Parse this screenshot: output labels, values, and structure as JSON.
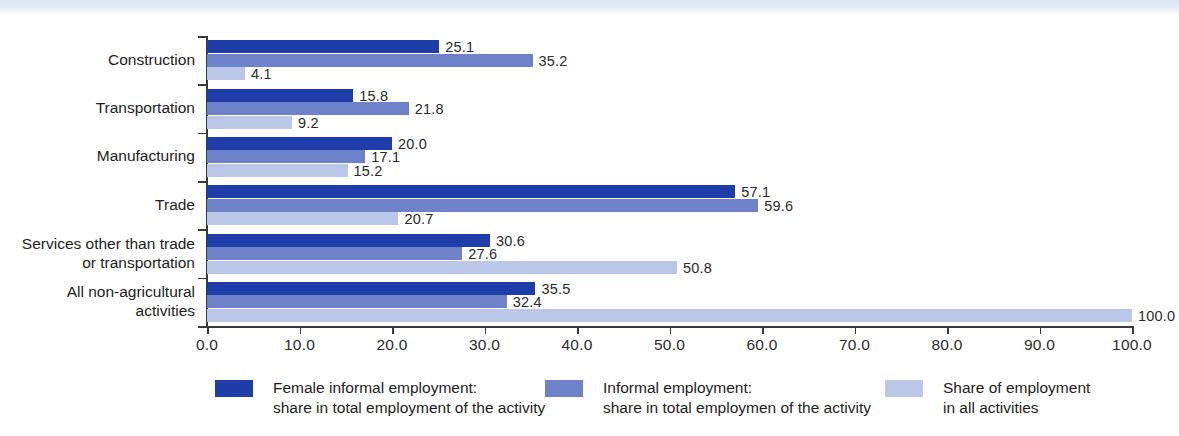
{
  "chart_data": {
    "type": "bar",
    "orientation": "horizontal",
    "title": "",
    "xlabel": "",
    "ylabel": "",
    "xlim": [
      0.0,
      100.0
    ],
    "grid": false,
    "legend_position": "bottom",
    "xticks": [
      "0.0",
      "10.0",
      "20.0",
      "30.0",
      "40.0",
      "50.0",
      "60.0",
      "70.0",
      "80.0",
      "90.0",
      "100.0"
    ],
    "xtick_values": [
      0,
      10,
      20,
      30,
      40,
      50,
      60,
      70,
      80,
      90,
      100
    ],
    "categories": [
      "Construction",
      "Transportation",
      "Manufacturing",
      "Trade",
      "Services other than trade\nor transportation",
      "All non-agricultural\nactivities"
    ],
    "series": [
      {
        "name": "Female informal employment:\nshare in total employment of the activity",
        "color": "#1f3da8",
        "values": [
          25.1,
          15.8,
          20.0,
          57.1,
          30.6,
          35.5
        ],
        "labels": [
          "25.1",
          "15.8",
          "20.0",
          "57.1",
          "30.6",
          "35.5"
        ]
      },
      {
        "name": "Informal employment:\nshare in total employmen of the activity",
        "color": "#6e82c9",
        "values": [
          35.2,
          21.8,
          17.1,
          59.6,
          27.6,
          32.4
        ],
        "labels": [
          "35.2",
          "21.8",
          "17.1",
          "59.6",
          "27.6",
          "32.4"
        ]
      },
      {
        "name": "Share of employment\nin all activities",
        "color": "#bac7e8",
        "values": [
          4.1,
          9.2,
          15.2,
          20.7,
          50.8,
          100.0
        ],
        "labels": [
          "4.1",
          "9.2",
          "15.2",
          "20.7",
          "50.8",
          "100.0"
        ]
      }
    ]
  },
  "legend": {
    "items": [
      {
        "swatch": "#1f3da8",
        "line1": "Female informal employment:",
        "line2": "share in total employment of the activity"
      },
      {
        "swatch": "#6e82c9",
        "line1": "Informal employment:",
        "line2": "share in total employmen of the activity"
      },
      {
        "swatch": "#bac7e8",
        "line1": "Share of employment",
        "line2": "in all activities"
      }
    ]
  },
  "colors": {
    "series_dark": "#1f3da8",
    "series_mid": "#6e82c9",
    "series_light": "#bac7e8",
    "axis": "#3a3a3a",
    "text": "#1d1d1d",
    "background": "#ffffff",
    "top_band": "#dbe6f4"
  }
}
